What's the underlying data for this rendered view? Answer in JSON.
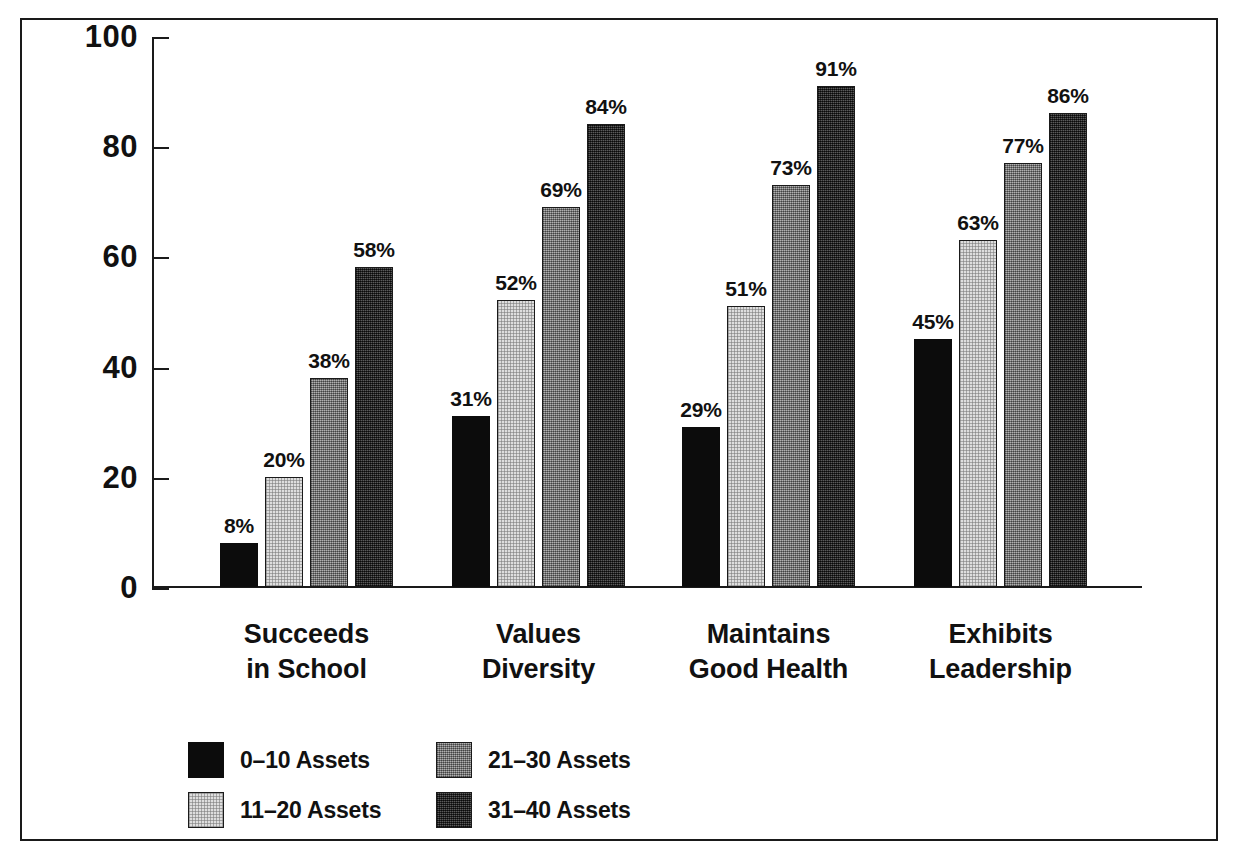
{
  "chart_data": {
    "type": "bar",
    "title": "",
    "subtitle": "",
    "xlabel": "",
    "ylabel": "",
    "ylim": [
      0,
      100
    ],
    "yticks": [
      0,
      20,
      40,
      60,
      80,
      100
    ],
    "ytick_labels": [
      "0",
      "20",
      "40",
      "60",
      "80",
      "100"
    ],
    "grid": false,
    "legend_position": "bottom-left",
    "value_label_suffix": "%",
    "categories": [
      "Succeeds\nin School",
      "Values\nDiversity",
      "Maintains\nGood Health",
      "Exhibits\nLeadership"
    ],
    "category_lines": [
      [
        "Succeeds",
        "in School"
      ],
      [
        "Values",
        "Diversity"
      ],
      [
        "Maintains",
        "Good Health"
      ],
      [
        "Exhibits",
        "Leadership"
      ]
    ],
    "series": [
      {
        "name": "0–10 Assets",
        "color": "#0c0c0c",
        "values": [
          8,
          31,
          29,
          45
        ],
        "labels": [
          "8%",
          "31%",
          "29%",
          "45%"
        ]
      },
      {
        "name": "11–20 Assets",
        "color": "#dedede",
        "values": [
          20,
          52,
          51,
          63
        ],
        "labels": [
          "20%",
          "52%",
          "51%",
          "63%"
        ]
      },
      {
        "name": "21–30 Assets",
        "color": "#8a8a8a",
        "values": [
          38,
          69,
          73,
          77
        ],
        "labels": [
          "38%",
          "69%",
          "73%",
          "77%"
        ]
      },
      {
        "name": "31–40 Assets",
        "color": "#333333",
        "values": [
          58,
          84,
          91,
          86
        ],
        "labels": [
          "58%",
          "84%",
          "91%",
          "86%"
        ]
      }
    ]
  },
  "axis": {
    "ytick_labels": [
      "100",
      "80",
      "60",
      "40",
      "20",
      "0"
    ]
  },
  "legend": {
    "items": [
      {
        "label": "0–10 Assets",
        "swatch": "black-swatch"
      },
      {
        "label": "11–20 Assets",
        "swatch": "light-gray-swatch"
      },
      {
        "label": "21–30 Assets",
        "swatch": "medium-gray-swatch"
      },
      {
        "label": "31–40 Assets",
        "swatch": "dark-gray-swatch"
      }
    ]
  },
  "colors": {
    "series_0": "#0c0c0c",
    "series_1": "#dedede",
    "series_2": "#8a8a8a",
    "series_3": "#333333",
    "axis": "#1a1a1a",
    "text": "#111111",
    "background": "#ffffff",
    "frame": "#1a1a1a"
  }
}
